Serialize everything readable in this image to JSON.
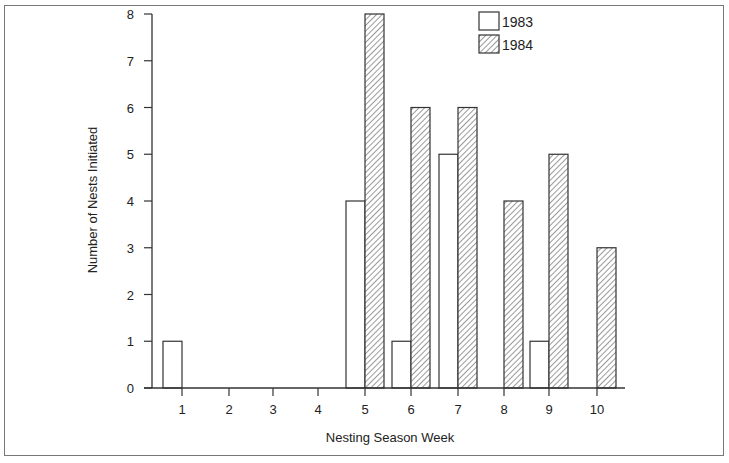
{
  "chart_data": {
    "type": "bar",
    "title": "",
    "xlabel": "Nesting Season Week",
    "ylabel": "Number of Nests Initiated",
    "categories": [
      "1",
      "2",
      "3",
      "4",
      "5",
      "6",
      "7",
      "8",
      "9",
      "10"
    ],
    "series": [
      {
        "name": "1983",
        "fill": "none",
        "values": [
          1,
          0,
          0,
          0,
          4,
          1,
          5,
          0,
          1,
          0
        ]
      },
      {
        "name": "1984",
        "fill": "hatched",
        "values": [
          0,
          0,
          0,
          0,
          8,
          6,
          6,
          4,
          5,
          3
        ]
      }
    ],
    "ylim": [
      0,
      8
    ],
    "yticks": [
      0,
      1,
      2,
      3,
      4,
      5,
      6,
      7,
      8
    ],
    "grid": false,
    "legend_position": "upper right"
  },
  "labels": {
    "ylabel": "Number of Nests Initiated",
    "xlabel": "Nesting Season Week",
    "legend": [
      "1983",
      "1984"
    ]
  },
  "colors": {
    "stroke": "#333333",
    "hatch": "#555555",
    "frame": "#777777",
    "background": "#ffffff"
  }
}
